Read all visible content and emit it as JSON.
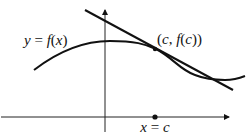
{
  "diagram": {
    "type": "tangent-line-illustration",
    "curve_label": {
      "y": "y",
      "eq": " = ",
      "f": "f",
      "open": "(",
      "x": "x",
      "close": ")"
    },
    "point_label": {
      "text_open": "(",
      "c1": "c",
      "comma": ", ",
      "f": "f",
      "paren_open": "(",
      "c2": "c",
      "paren_close": "))"
    },
    "axis_label": {
      "x": "x",
      "eq": " = ",
      "c": "c"
    },
    "colors": {
      "stroke": "#111111",
      "background": "#ffffff"
    }
  }
}
